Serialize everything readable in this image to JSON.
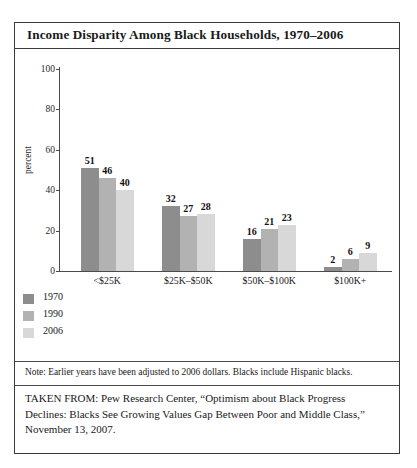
{
  "figure": {
    "title": "Income Disparity Among Black Households, 1970–2006",
    "note": "Note: Earlier years have been adjusted to 2006 dollars. Blacks include Hispanic blacks.",
    "source": "TAKEN FROM: Pew Research Center, “Optimism about Black Progress Declines: Blacks See Growing Values Gap Between Poor and Middle Class,” November 13, 2007."
  },
  "chart_data": {
    "type": "bar",
    "title": "Income Disparity Among Black Households, 1970–2006",
    "xlabel": "",
    "ylabel": "percent",
    "ylim": [
      0,
      100
    ],
    "yticks": [
      0,
      20,
      40,
      60,
      80,
      100
    ],
    "grid": false,
    "legend_position": "below-left",
    "categories": [
      "<$25K",
      "$25K–$50K",
      "$50K–$100K",
      "$100K+"
    ],
    "series": [
      {
        "name": "1970",
        "color": "#8d8d8d",
        "values": [
          51,
          32,
          16,
          2
        ]
      },
      {
        "name": "1990",
        "color": "#b2b2b2",
        "values": [
          46,
          27,
          21,
          6
        ]
      },
      {
        "name": "2006",
        "color": "#d8d8d8",
        "values": [
          40,
          28,
          23,
          9
        ]
      }
    ]
  },
  "colors": {
    "frame": "#3a3a3a",
    "axis": "#4a4a4a",
    "text": "#1a1a1a"
  }
}
